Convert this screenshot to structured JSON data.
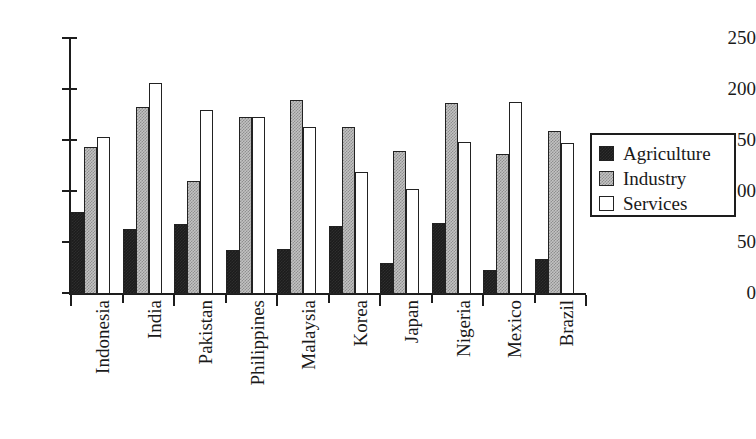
{
  "chart_data": {
    "type": "bar",
    "title": "",
    "xlabel": "",
    "ylabel": "",
    "ylim": [
      0,
      250
    ],
    "yticks": [
      0,
      50,
      100,
      150,
      200,
      250
    ],
    "grid": false,
    "legend_position": "right",
    "categories": [
      "Indonesia",
      "India",
      "Pakistan",
      "Philippines",
      "Malaysia",
      "Korea",
      "Japan",
      "Nigeria",
      "Mexico",
      "Brazil"
    ],
    "series": [
      {
        "name": "Agriculture",
        "color": "#1c1c1c",
        "values": [
          80,
          64,
          69,
          43,
          44,
          67,
          30,
          70,
          24,
          34
        ]
      },
      {
        "name": "Industry",
        "color": "#b0b0b0",
        "values": [
          144,
          183,
          111,
          174,
          190,
          164,
          140,
          187,
          137,
          160
        ]
      },
      {
        "name": "Services",
        "color": "#ffffff",
        "values": [
          154,
          207,
          180,
          174,
          164,
          120,
          103,
          149,
          188,
          148
        ]
      }
    ]
  },
  "legend": {
    "items": [
      {
        "label": "Agriculture",
        "swatch": "agriculture"
      },
      {
        "label": "Industry",
        "swatch": "industry"
      },
      {
        "label": "Services",
        "swatch": "services"
      }
    ]
  },
  "axis": {
    "y_tick_labels": [
      "250",
      "200",
      "150",
      "100",
      "50",
      "0"
    ]
  }
}
